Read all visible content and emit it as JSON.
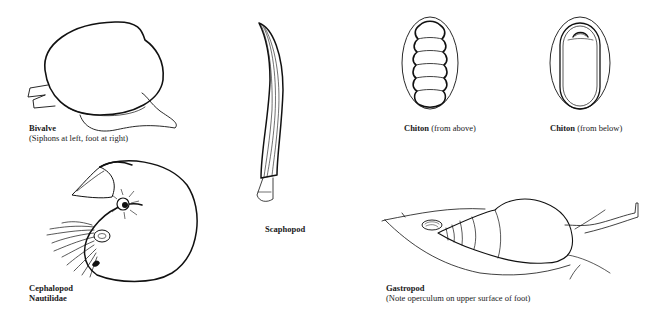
{
  "figures": [
    {
      "id": "bivalve",
      "name": "Bivalve",
      "caption": "(Siphons at left, foot at right)"
    },
    {
      "id": "cephalopod",
      "name": "Cephalopod",
      "caption": "Nautilidae"
    },
    {
      "id": "scaphopod",
      "name": "Scaphopod",
      "caption": ""
    },
    {
      "id": "chiton-above",
      "name": "Chiton",
      "caption": " (from above)"
    },
    {
      "id": "chiton-below",
      "name": "Chiton",
      "caption": " (from below)"
    },
    {
      "id": "gastropod",
      "name": "Gastropod",
      "caption": "(Note operculum on upper surface of foot)"
    }
  ],
  "colors": {
    "ink": "#111111",
    "background": "#ffffff"
  }
}
